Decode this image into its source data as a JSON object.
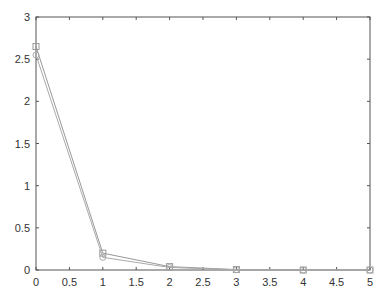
{
  "chart_data": {
    "type": "line",
    "title": "",
    "xlabel": "",
    "ylabel": "",
    "xlim": [
      0,
      5
    ],
    "ylim": [
      0,
      3
    ],
    "grid": false,
    "legend": null,
    "x": [
      0,
      1,
      2,
      3,
      4,
      5
    ],
    "xticks": [
      "0",
      "0.5",
      "1",
      "1.5",
      "2",
      "2.5",
      "3",
      "3.5",
      "4",
      "4.5",
      "5"
    ],
    "yticks": [
      "0",
      "0.5",
      "1",
      "1.5",
      "2",
      "2.5",
      "3"
    ],
    "series": [
      {
        "name": "series-squares",
        "marker": "square",
        "color": "#999999",
        "values": [
          2.65,
          0.2,
          0.04,
          0.005,
          0.0,
          0.0
        ]
      },
      {
        "name": "series-circles",
        "marker": "circle",
        "color": "#aaaaaa",
        "values": [
          2.55,
          0.15,
          0.03,
          0.003,
          0.0,
          0.0
        ]
      }
    ]
  },
  "colors": {
    "axis": "#555555",
    "line": "#999999",
    "background": "#ffffff"
  }
}
